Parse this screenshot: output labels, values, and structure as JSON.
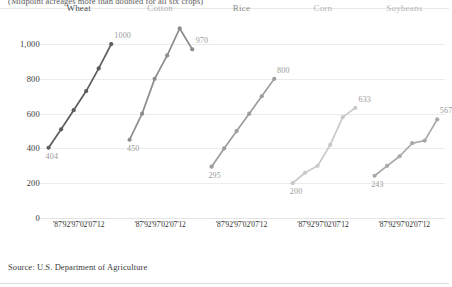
{
  "kicker": "(Midpoint acreages more than doubled for all six crops)",
  "source": "Source: U.S. Department of Agriculture",
  "axis": {
    "yticks": [
      "0",
      "200",
      "400",
      "600",
      "800",
      "1,000"
    ],
    "ytick_values": [
      0,
      200,
      400,
      600,
      800,
      1000
    ],
    "xticks": [
      "'87",
      "'92",
      "'97",
      "'02",
      "'07",
      "'12"
    ],
    "ylim": [
      0,
      1150
    ]
  },
  "colors": {
    "wheat": "#5c5c5c",
    "cotton": "#8d8d8d",
    "rice": "#9d9d9d",
    "corn": "#c9c9c9",
    "soybeans": "#a8a8a8",
    "grid": "#ececec",
    "label": "#9a9a9a",
    "background": "#ffffff"
  },
  "chart_data": {
    "type": "line",
    "title": "(Midpoint acreages more than doubled for all six crops)",
    "xlabel": "",
    "ylabel": "",
    "ylim": [
      0,
      1150
    ],
    "grid": true,
    "legend": "none",
    "layout": "small-multiples",
    "x": [
      1987,
      1992,
      1997,
      2002,
      2007,
      2012
    ],
    "tick_labels": [
      "'87",
      "'92",
      "'97",
      "'02",
      "'07",
      "'12"
    ],
    "series": [
      {
        "name": "Wheat",
        "color": "#5c5c5c",
        "values": [
          404,
          510,
          620,
          730,
          860,
          1000
        ],
        "start_label": "404",
        "end_label": "1000"
      },
      {
        "name": "Cotton",
        "color": "#8d8d8d",
        "values": [
          450,
          600,
          800,
          935,
          1090,
          970
        ],
        "start_label": "450",
        "end_label": "970"
      },
      {
        "name": "Rice",
        "color": "#9d9d9d",
        "values": [
          295,
          400,
          500,
          600,
          700,
          800
        ],
        "start_label": "295",
        "end_label": "800"
      },
      {
        "name": "Corn",
        "color": "#c9c9c9",
        "values": [
          200,
          260,
          300,
          420,
          580,
          633
        ],
        "start_label": "200",
        "end_label": "633"
      },
      {
        "name": "Soybeans",
        "color": "#a8a8a8",
        "values": [
          243,
          300,
          355,
          430,
          445,
          567
        ],
        "start_label": "243",
        "end_label": "567"
      }
    ]
  }
}
